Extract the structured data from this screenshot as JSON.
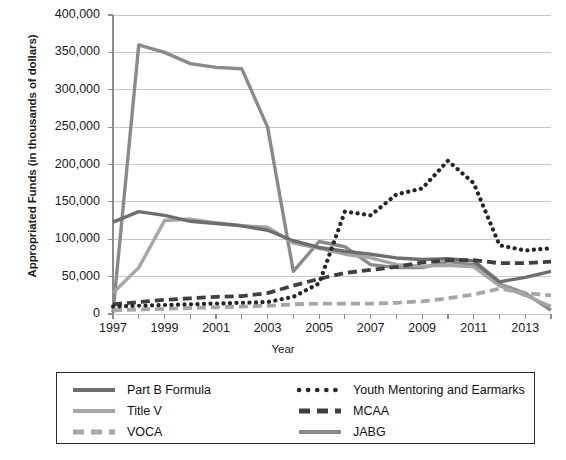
{
  "axes": {
    "y_title": "Appropriated Funds (in thousands of dollars)",
    "x_title": "Year",
    "y_ticks": [
      "400,000",
      "350,000",
      "300,000",
      "250,000",
      "200,000",
      "150,000",
      "100,000",
      "50,000",
      "0"
    ],
    "x_ticks": [
      "1997",
      "1999",
      "2001",
      "2003",
      "2005",
      "2007",
      "2009",
      "2011",
      "2013"
    ]
  },
  "legend": {
    "items": [
      {
        "label": "Part B Formula",
        "style": "solid",
        "color": "#6e6e6e"
      },
      {
        "label": "Title V",
        "style": "solid",
        "color": "#a6a6a6"
      },
      {
        "label": "VOCA",
        "style": "dashed",
        "color": "#a6a6a6"
      },
      {
        "label": "Youth Mentoring and Earmarks",
        "style": "dotted",
        "color": "#262626"
      },
      {
        "label": "MCAA",
        "style": "dashed",
        "color": "#3f3f3f"
      },
      {
        "label": "JABG",
        "style": "solid",
        "color": "#8a8a8a"
      }
    ]
  },
  "chart_data": {
    "type": "line",
    "title": "",
    "xlabel": "Year",
    "ylabel": "Appropriated Funds (in thousands of dollars)",
    "xlim": [
      1997,
      2014
    ],
    "ylim": [
      0,
      400000
    ],
    "ytick_step": 50000,
    "grid": "horizontal",
    "legend_position": "bottom",
    "x": [
      1997,
      1998,
      1999,
      2000,
      2001,
      2002,
      2003,
      2004,
      2005,
      2006,
      2007,
      2008,
      2009,
      2010,
      2011,
      2012,
      2013,
      2014
    ],
    "series": [
      {
        "name": "Part B Formula",
        "color": "#6e6e6e",
        "style": "solid",
        "values": [
          123000,
          137000,
          132000,
          124000,
          121000,
          118000,
          112000,
          98000,
          89000,
          84000,
          80000,
          75000,
          73000,
          74000,
          71000,
          43000,
          49000,
          57000
        ]
      },
      {
        "name": "Title V",
        "color": "#a6a6a6",
        "style": "solid",
        "values": [
          28000,
          62000,
          125000,
          127000,
          122000,
          118000,
          116000,
          95000,
          88000,
          80000,
          75000,
          66000,
          64000,
          65000,
          63000,
          38000,
          25000,
          10000
        ]
      },
      {
        "name": "VOCA",
        "color": "#a6a6a6",
        "style": "dashed",
        "values": [
          5000,
          6000,
          7000,
          8000,
          9000,
          10000,
          11000,
          13000,
          14000,
          14000,
          14000,
          15000,
          17000,
          21000,
          26000,
          34000,
          28000,
          25000
        ]
      },
      {
        "name": "Youth Mentoring and Earmarks",
        "color": "#262626",
        "style": "dotted",
        "values": [
          10000,
          11000,
          12000,
          13000,
          14000,
          15000,
          16000,
          23000,
          41000,
          137000,
          132000,
          160000,
          168000,
          205000,
          175000,
          92000,
          85000,
          88000
        ]
      },
      {
        "name": "MCAA",
        "color": "#3f3f3f",
        "style": "dashed",
        "values": [
          13000,
          16000,
          19000,
          21000,
          23000,
          24000,
          28000,
          38000,
          47000,
          55000,
          59000,
          63000,
          69000,
          72000,
          72000,
          68000,
          68000,
          70000
        ]
      },
      {
        "name": "JABG",
        "color": "#8a8a8a",
        "style": "solid",
        "values": [
          2000,
          360000,
          350000,
          335000,
          330000,
          328000,
          250000,
          57000,
          97000,
          90000,
          66000,
          62000,
          62000,
          70000,
          66000,
          40000,
          28000,
          5000
        ]
      }
    ]
  }
}
